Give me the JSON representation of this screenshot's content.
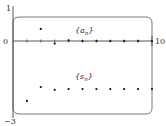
{
  "chart_data": {
    "type": "scatter",
    "title": "",
    "xlabel": "",
    "ylabel": "",
    "xlim": [
      0,
      10
    ],
    "ylim": [
      -3,
      1
    ],
    "x_tick_labels": [
      "0",
      "10"
    ],
    "y_tick_labels": [
      "1",
      "0",
      "-3"
    ],
    "grid": false,
    "legend": "inline labels",
    "series": [
      {
        "name": "{a_n}",
        "x": [
          1,
          2,
          3,
          4,
          5,
          6,
          7,
          8,
          9,
          10
        ],
        "values": [
          -2.33,
          0.47,
          -0.1,
          0.03,
          0.0,
          0.0,
          0.0,
          0.0,
          0.0,
          0.0
        ]
      },
      {
        "name": "{s_n}",
        "x": [
          1,
          2,
          3,
          4,
          5,
          6,
          7,
          8,
          9,
          10
        ],
        "values": [
          -2.33,
          -1.79,
          -1.9,
          -1.87,
          -1.87,
          -1.87,
          -1.87,
          -1.87,
          -1.87,
          -1.87
        ]
      }
    ]
  },
  "labels": {
    "y_top": "1",
    "y_zero": "0",
    "y_bottom": "−3",
    "x_right": "10",
    "series_a": "{a",
    "series_a_sub": "n",
    "series_a_close": "}",
    "series_s": "{s",
    "series_s_sub": "n",
    "series_s_close": "}"
  }
}
